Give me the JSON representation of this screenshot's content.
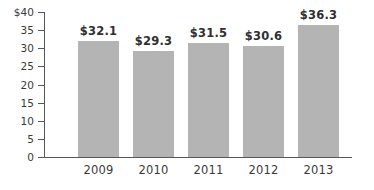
{
  "chart_data": {
    "type": "bar",
    "title": "",
    "subtitle": "",
    "xlabel": "",
    "ylabel": "",
    "categories": [
      "2009",
      "2010",
      "2011",
      "2012",
      "2013"
    ],
    "values": [
      32.1,
      29.3,
      31.5,
      30.6,
      36.3
    ],
    "value_labels": [
      "$32.1",
      "$29.3",
      "$31.5",
      "$30.6",
      "$36.3"
    ],
    "ylim": [
      0,
      40
    ],
    "ytick_values": [
      40,
      35,
      30,
      25,
      20,
      15,
      10,
      5,
      0
    ],
    "ytick_labels": [
      "$40",
      "35",
      "30",
      "25",
      "20",
      "15",
      "10",
      "5",
      "0"
    ],
    "grid": false,
    "legend": null,
    "legend_position": "none",
    "series": [
      {
        "name": "",
        "values": [
          32.1,
          29.3,
          31.5,
          30.6,
          36.3
        ],
        "color": "#b4b4b4"
      }
    ],
    "colors": {
      "bar_fill": "#b4b4b4",
      "axis_line": "#58585a",
      "tick_label": "#3a3a3c",
      "value_label": "#2f2f31",
      "background": "#ffffff"
    }
  }
}
